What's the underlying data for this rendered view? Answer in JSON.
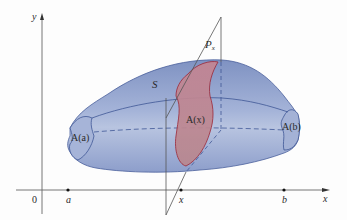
{
  "figure": {
    "type": "solid-of-cross-section",
    "labels": {
      "y_axis": "y",
      "x_axis": "x",
      "origin": "0",
      "a": "a",
      "b": "b",
      "x_point": "x",
      "solid": "S",
      "plane": "P",
      "plane_sub": "x",
      "cross_section": "A(x)",
      "left_end": "A(a)",
      "right_end": "A(b)"
    },
    "colors": {
      "solid_fill": "#8d9ecb",
      "solid_fill_light": "#b3c0de",
      "solid_edge": "#3f5796",
      "section_fill": "#c68c98",
      "section_edge": "#9e2a3a",
      "axis": "#555555",
      "plane_edge": "#555555"
    },
    "axis_points": [
      {
        "name": "a",
        "x": 68
      },
      {
        "name": "x",
        "x": 181
      },
      {
        "name": "b",
        "x": 284
      }
    ]
  }
}
